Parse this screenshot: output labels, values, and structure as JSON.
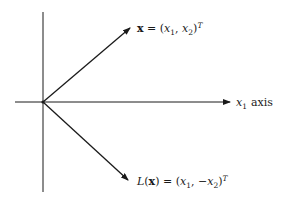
{
  "diagram": {
    "title": "",
    "axes": {
      "horizontal_label_var": "x",
      "horizontal_label_sub": "1",
      "horizontal_label_word": "axis"
    },
    "vectors": [
      {
        "name": "x",
        "label_lhs": "x",
        "label_eq": " = (",
        "label_v1": "x",
        "label_v1_sub": "1",
        "label_sep": ", ",
        "label_v2": "x",
        "label_v2_sub": "2",
        "label_close": ")",
        "label_sup": "T"
      },
      {
        "name": "L(x)",
        "label_fn": "L",
        "label_open": "(",
        "label_arg": "x",
        "label_eq": ") = (",
        "label_v1": "x",
        "label_v1_sub": "1",
        "label_sep": ", −",
        "label_v2": "x",
        "label_v2_sub": "2",
        "label_close": ")",
        "label_sup": "T"
      }
    ],
    "colors": {
      "ink": "#1a1a1a",
      "background": "#ffffff"
    }
  }
}
